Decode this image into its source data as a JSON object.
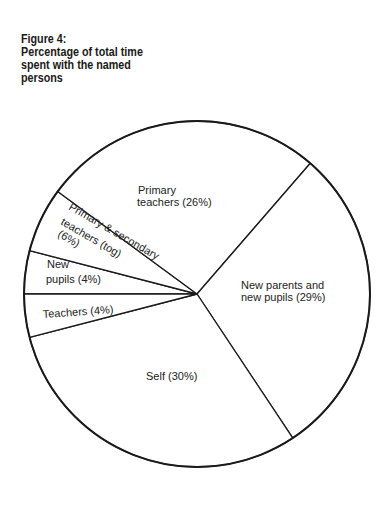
{
  "chart_data": {
    "type": "pie",
    "title": [
      "Figure 4:",
      "Percentage of total time",
      "spent with the named",
      "persons"
    ],
    "start_boundary": "left-horizontal",
    "direction": "clockwise",
    "slices": [
      {
        "name": "New pupils",
        "value": 4,
        "label_lines": [
          "New",
          "pupils (4%)"
        ]
      },
      {
        "name": "Primary & secondary teachers (tog)",
        "value": 6,
        "label_lines": [
          "Primary & secondary",
          "teachers (tog)",
          "(6%)"
        ]
      },
      {
        "name": "Primary teachers",
        "value": 26,
        "label_lines": [
          "Primary",
          "teachers (26%)"
        ]
      },
      {
        "name": "New parents and new pupils",
        "value": 29,
        "label_lines": [
          "New parents and",
          "new pupils (29%)"
        ]
      },
      {
        "name": "Self",
        "value": 30,
        "label_lines": [
          "Self (30%)"
        ]
      },
      {
        "name": "Teachers",
        "value": 4,
        "label_lines": [
          "Teachers (4%)"
        ]
      }
    ],
    "unit": "%",
    "legend": "none",
    "colors": {
      "stroke": "#1a1a1a",
      "fill": "#ffffff"
    }
  }
}
